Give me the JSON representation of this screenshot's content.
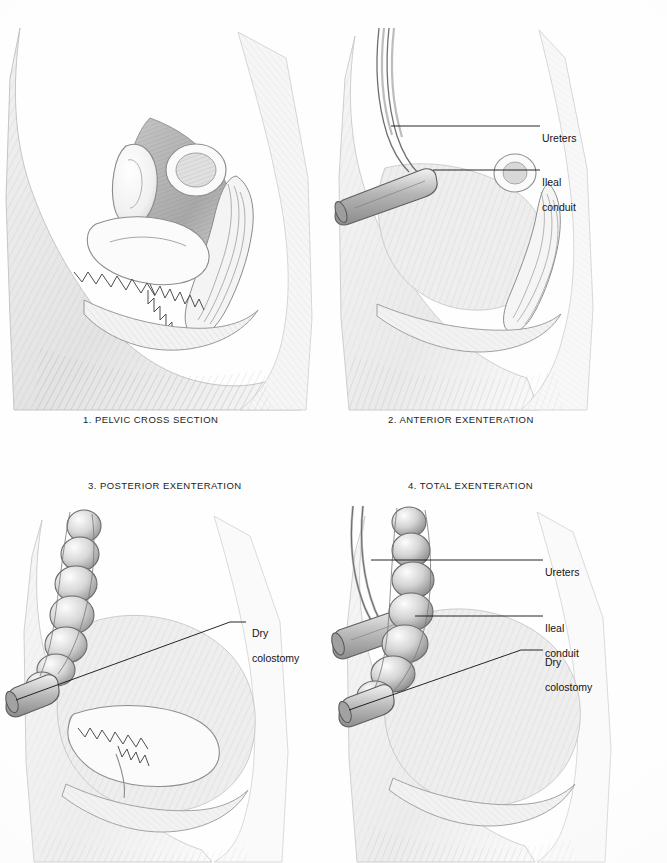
{
  "plate": {
    "title": "Pelvic exenteration procedures",
    "background_color": "#ffffff",
    "ink_color": "#141414",
    "panel_count": 4
  },
  "panels": [
    {
      "id": "panel-1",
      "number": "1.",
      "caption": "1. PELVIC CROSS SECTION",
      "caption_position": "below",
      "subject": "female pelvis sagittal section, intact organs",
      "structures": [
        "uterus",
        "bladder",
        "rectum",
        "vagina",
        "sacrum",
        "pubic bone",
        "abdominal wall"
      ],
      "labels": []
    },
    {
      "id": "panel-2",
      "number": "2.",
      "caption": "2. ANTERIOR EXENTERATION",
      "caption_position": "below",
      "subject": "female pelvis sagittal section, bladder removed, urinary diversion",
      "structures": [
        "ureters",
        "ileal conduit stoma",
        "rectum",
        "abdominal wall"
      ],
      "labels": [
        {
          "text": "Ureters",
          "lines": [
            "Ureters"
          ]
        },
        {
          "text": "Ileal conduit",
          "lines": [
            "Ileal",
            "conduit"
          ]
        }
      ]
    },
    {
      "id": "panel-3",
      "number": "3.",
      "caption": "3. POSTERIOR EXENTERATION",
      "caption_position": "above",
      "subject": "female pelvis sagittal section, rectum removed, colostomy",
      "structures": [
        "descending colon",
        "dry colostomy stoma",
        "bladder",
        "vagina"
      ],
      "labels": [
        {
          "text": "Dry colostomy",
          "lines": [
            "Dry",
            "colostomy"
          ]
        }
      ]
    },
    {
      "id": "panel-4",
      "number": "4.",
      "caption": "4. TOTAL EXENTERATION",
      "caption_position": "above",
      "subject": "female pelvis sagittal section, all pelvic organs removed, both diversions",
      "structures": [
        "ureters",
        "ileal conduit stoma",
        "descending colon",
        "dry colostomy stoma"
      ],
      "labels": [
        {
          "text": "Ureters",
          "lines": [
            "Ureters"
          ]
        },
        {
          "text": "Ileal conduit",
          "lines": [
            "Ileal",
            "conduit"
          ]
        },
        {
          "text": "Dry colostomy",
          "lines": [
            "Dry",
            "colostomy"
          ]
        }
      ]
    }
  ],
  "labels_flat": {
    "p2_ureters": "Ureters",
    "p2_ileal_1": "Ileal",
    "p2_ileal_2": "conduit",
    "p3_dry_1": "Dry",
    "p3_dry_2": "colostomy",
    "p4_ureters": "Ureters",
    "p4_ileal_1": "Ileal",
    "p4_ileal_2": "conduit",
    "p4_dry_1": "Dry",
    "p4_dry_2": "colostomy"
  },
  "captions_flat": {
    "p1": "1. PELVIC CROSS SECTION",
    "p2": "2. ANTERIOR EXENTERATION",
    "p3": "3. POSTERIOR EXENTERATION",
    "p4": "4. TOTAL EXENTERATION"
  }
}
